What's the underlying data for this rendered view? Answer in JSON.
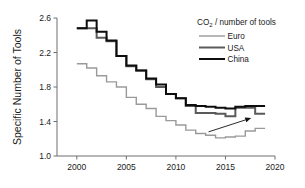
{
  "chart_data": {
    "type": "line",
    "title": "",
    "subtitle": "",
    "xlabel": "",
    "ylabel": "Specific Number of Tools",
    "xlim": [
      1998,
      2020
    ],
    "ylim": [
      1.0,
      2.6
    ],
    "grid": false,
    "legend_position": "top-right",
    "legend_title": "CO₂ / number of tools",
    "x_ticks": [
      "2000",
      "2005",
      "2010",
      "2015",
      "2020"
    ],
    "x_tick_values": [
      2000,
      2005,
      2010,
      2015,
      2020
    ],
    "y_ticks": [
      "1.0",
      "1.4",
      "1.8",
      "2.2",
      "2.6"
    ],
    "y_tick_values": [
      1.0,
      1.4,
      1.8,
      2.2,
      2.6
    ],
    "x": [
      2000,
      2001,
      2002,
      2003,
      2004,
      2005,
      2006,
      2007,
      2008,
      2009,
      2010,
      2011,
      2012,
      2013,
      2014,
      2015,
      2016,
      2017,
      2018
    ],
    "series": [
      {
        "name": "Euro",
        "color": "#9a9a9a",
        "line_width": 1.4,
        "values": [
          2.07,
          2.02,
          1.93,
          1.86,
          1.8,
          1.68,
          1.6,
          1.55,
          1.46,
          1.41,
          1.36,
          1.3,
          1.26,
          1.24,
          1.21,
          1.22,
          1.23,
          1.29,
          1.32
        ]
      },
      {
        "name": "USA",
        "color": "#5a5a5a",
        "line_width": 2.0,
        "values": [
          2.48,
          2.48,
          2.37,
          2.33,
          2.16,
          2.04,
          1.99,
          1.89,
          1.8,
          1.72,
          1.67,
          1.58,
          1.5,
          1.5,
          1.49,
          1.46,
          1.56,
          1.56,
          1.49
        ]
      },
      {
        "name": "China",
        "color": "#0d0d0d",
        "line_width": 2.0,
        "values": [
          2.48,
          2.57,
          2.44,
          2.34,
          2.16,
          2.05,
          1.99,
          1.9,
          1.83,
          1.72,
          1.67,
          1.59,
          1.58,
          1.57,
          1.56,
          1.55,
          1.57,
          1.58,
          1.58
        ]
      }
    ],
    "annotations": [
      {
        "name": "trend-arrow",
        "type": "arrow",
        "from": [
          2013.3,
          1.28
        ],
        "to": [
          2017.6,
          1.44
        ],
        "color": "#111111"
      }
    ]
  },
  "axes": {
    "y_axis_title": "Specific Number of Tools"
  },
  "legend": {
    "title": "CO₂ / number of tools",
    "title_main": "CO",
    "title_sub": "2",
    "title_rest": " / number of tools",
    "entries": [
      {
        "label": "Euro",
        "color": "#9a9a9a"
      },
      {
        "label": "USA",
        "color": "#5a5a5a"
      },
      {
        "label": "China",
        "color": "#0d0d0d"
      }
    ]
  }
}
